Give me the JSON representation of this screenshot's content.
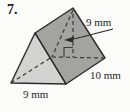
{
  "figure": {
    "problem_number": "7.",
    "shape": "triangular-prism",
    "labels": {
      "triangle_height": "9 mm",
      "prism_length": "10 mm",
      "triangle_base": "9 mm"
    },
    "colors": {
      "background": "#fbfbf9",
      "front_face": "#d3d3d1",
      "side_face": "#a3a39f",
      "edge": "#2b2b2b",
      "hidden_line": "#3a3a3a",
      "text": "#1e1e1e"
    }
  }
}
